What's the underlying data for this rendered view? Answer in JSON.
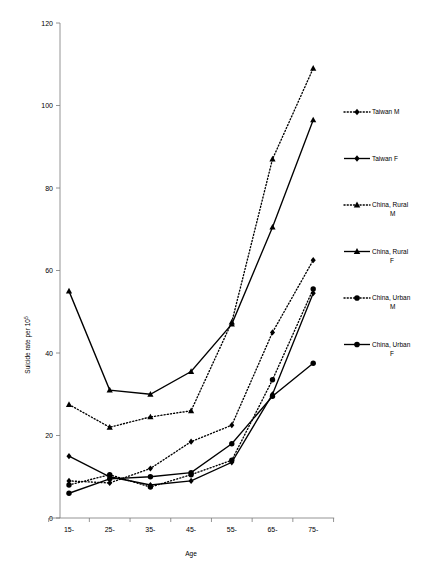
{
  "chart_data": {
    "type": "line",
    "title": "",
    "xlabel": "Age",
    "ylabel": "Suicide rate per 10",
    "ylabel_superscript": "5",
    "categories": [
      "15-",
      "25-",
      "35-",
      "45-",
      "55-",
      "65-",
      "75-"
    ],
    "ylim": [
      0,
      120
    ],
    "yticks": [
      0,
      20,
      40,
      60,
      80,
      100,
      120
    ],
    "grid": false,
    "legend_position": "right",
    "series": [
      {
        "name": "Taiwan M",
        "marker": "diamond",
        "line": "dotted",
        "color": "#000000",
        "values": [
          9,
          8.5,
          12,
          18.5,
          22.5,
          45,
          62.5
        ]
      },
      {
        "name": "Taiwan F",
        "marker": "diamond",
        "line": "solid",
        "color": "#000000",
        "values": [
          15,
          10,
          8,
          9,
          13.5,
          30,
          54.5
        ]
      },
      {
        "name": "China, Rural M",
        "marker": "triangle",
        "line": "dotted",
        "color": "#000000",
        "values": [
          27.5,
          22,
          24.5,
          26,
          47.5,
          87,
          109
        ]
      },
      {
        "name": "China, Rural F",
        "marker": "triangle",
        "line": "solid",
        "color": "#000000",
        "values": [
          55,
          31,
          30,
          35.5,
          47,
          70.5,
          96.5
        ]
      },
      {
        "name": "China, Urban M",
        "marker": "circle",
        "line": "dotted",
        "color": "#000000",
        "values": [
          8,
          10.5,
          7.5,
          10.5,
          14,
          33.5,
          55.5
        ]
      },
      {
        "name": "China, Urban F",
        "marker": "circle",
        "line": "solid",
        "color": "#000000",
        "values": [
          6,
          9.5,
          10,
          11,
          18,
          29.5,
          37.5
        ]
      }
    ]
  },
  "legend": {
    "items": [
      {
        "label_line1": "Taiwan M",
        "label_line2": ""
      },
      {
        "label_line1": "Taiwan F",
        "label_line2": ""
      },
      {
        "label_line1": "China, Rural",
        "label_line2": "M"
      },
      {
        "label_line1": "China, Rural",
        "label_line2": "F"
      },
      {
        "label_line1": "China, Urban",
        "label_line2": "M"
      },
      {
        "label_line1": "China, Urban",
        "label_line2": "F"
      }
    ]
  },
  "axes": {
    "y_title_main": "Suicide rate per 10",
    "y_title_sup": "5",
    "x_title": "Age"
  }
}
